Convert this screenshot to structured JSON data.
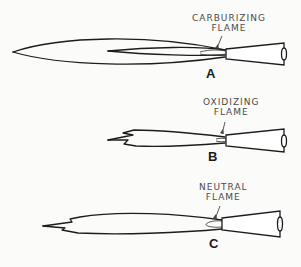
{
  "figure": {
    "panels": [
      {
        "id": "A",
        "label": "A",
        "caption_line1": "CARBURIZING",
        "caption_line2": "FLAME"
      },
      {
        "id": "B",
        "label": "B",
        "caption_line1": "OXIDIZING",
        "caption_line2": "FLAME"
      },
      {
        "id": "C",
        "label": "C",
        "caption_line1": "NEUTRAL",
        "caption_line2": "FLAME"
      }
    ]
  }
}
